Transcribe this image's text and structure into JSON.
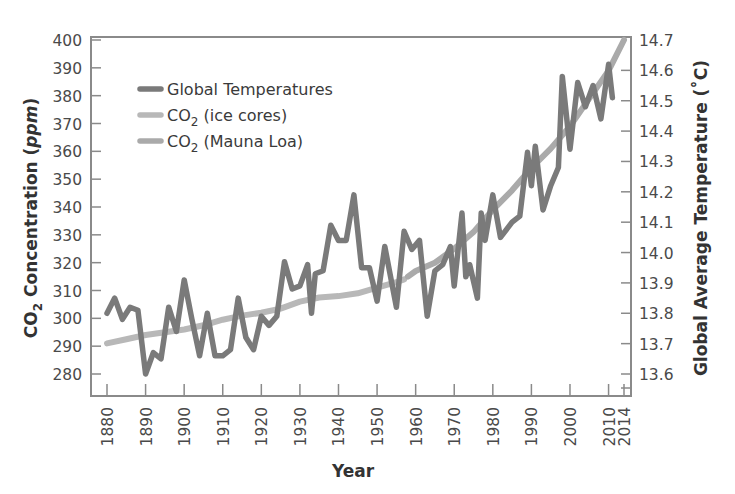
{
  "chart_data": {
    "type": "line",
    "title": "",
    "xlabel": "Year",
    "ylabel_left": "CO2 Concentration (ppm)",
    "ylabel_right": "Global Average Temperature (°C)",
    "xlim": [
      1876,
      2016
    ],
    "ylim_left": [
      280,
      400
    ],
    "ylim_right": [
      13.6,
      14.7
    ],
    "x_ticks": [
      1880,
      1890,
      1900,
      1910,
      1920,
      1930,
      1940,
      1950,
      1960,
      1970,
      1980,
      1990,
      2000,
      2010,
      2014
    ],
    "y_left_ticks": [
      280,
      290,
      300,
      310,
      320,
      330,
      340,
      350,
      360,
      370,
      380,
      390,
      400
    ],
    "y_right_ticks": [
      "13.6",
      "13.7",
      "13.8",
      "13.9",
      "14.0",
      "14.1",
      "14.2",
      "14.3",
      "14.4",
      "14.5",
      "14.6",
      "14.7"
    ],
    "grid": false,
    "legend_position": "upper-left",
    "series": [
      {
        "name": "Global Temperatures",
        "axis": "right",
        "color": "#7a7a7a",
        "x": [
          1880,
          1882,
          1884,
          1886,
          1888,
          1890,
          1892,
          1894,
          1896,
          1898,
          1900,
          1902,
          1904,
          1906,
          1908,
          1910,
          1912,
          1914,
          1916,
          1918,
          1920,
          1922,
          1924,
          1926,
          1928,
          1930,
          1932,
          1933,
          1934,
          1936,
          1938,
          1940,
          1942,
          1944,
          1946,
          1948,
          1950,
          1952,
          1955,
          1957,
          1959,
          1961,
          1963,
          1965,
          1967,
          1969,
          1970,
          1972,
          1973,
          1974,
          1976,
          1977,
          1978,
          1980,
          1982,
          1985,
          1987,
          1989,
          1990,
          1991,
          1993,
          1995,
          1997,
          1998,
          2000,
          2002,
          2004,
          2006,
          2008,
          2010,
          2011
        ],
        "values": [
          13.8,
          13.85,
          13.78,
          13.82,
          13.81,
          13.6,
          13.67,
          13.65,
          13.82,
          13.74,
          13.91,
          13.78,
          13.66,
          13.8,
          13.66,
          13.66,
          13.68,
          13.85,
          13.72,
          13.68,
          13.79,
          13.76,
          13.79,
          13.97,
          13.88,
          13.89,
          13.96,
          13.8,
          13.93,
          13.94,
          14.09,
          14.04,
          14.04,
          14.19,
          13.95,
          13.95,
          13.84,
          14.02,
          13.82,
          14.07,
          14.01,
          14.04,
          13.79,
          13.94,
          13.96,
          14.02,
          13.89,
          14.13,
          13.92,
          13.96,
          13.85,
          14.13,
          14.04,
          14.19,
          14.05,
          14.1,
          14.12,
          14.33,
          14.22,
          14.35,
          14.14,
          14.22,
          14.28,
          14.58,
          14.34,
          14.56,
          14.48,
          14.55,
          14.44,
          14.62,
          14.51
        ]
      },
      {
        "name": "CO2 (ice cores)",
        "axis": "left",
        "color": "#b8b8b8",
        "x": [
          1880,
          1885,
          1890,
          1895,
          1900,
          1905,
          1910,
          1915,
          1920,
          1925,
          1930,
          1935,
          1940,
          1945,
          1950,
          1955,
          1957
        ],
        "values": [
          291,
          292.5,
          294,
          295,
          296,
          297.5,
          299.5,
          301,
          302,
          303.5,
          306,
          307.5,
          308,
          309,
          311,
          313,
          314
        ]
      },
      {
        "name": "CO2 (Mauna Loa)",
        "axis": "left",
        "color": "#aaaaaa",
        "x": [
          1958,
          1960,
          1965,
          1970,
          1975,
          1980,
          1985,
          1990,
          1995,
          2000,
          2005,
          2010,
          2014
        ],
        "values": [
          315,
          317,
          320,
          325,
          331,
          339,
          346,
          354,
          361,
          369,
          379,
          389,
          400
        ]
      }
    ]
  },
  "legend": {
    "items": [
      {
        "label": "Global Temperatures",
        "main": "Global Temperatures",
        "sub": "",
        "rest": "",
        "color": "#7a7a7a"
      },
      {
        "label": "CO2 (ice cores)",
        "main": "CO",
        "sub": "2",
        "rest": " (ice cores)",
        "color": "#b8b8b8"
      },
      {
        "label": "CO2 (Mauna Loa)",
        "main": "CO",
        "sub": "2",
        "rest": " (Mauna Loa)",
        "color": "#aaaaaa"
      }
    ]
  },
  "axes": {
    "x_title": "Year",
    "left_title_main": "CO",
    "left_title_sub": "2",
    "left_title_rest": " Concentration (",
    "left_title_unit": "ppm",
    "left_title_close": ")",
    "right_title": "Global Average Temperature (˚C)"
  },
  "style": {
    "frame_color": "#8a8a8a",
    "text_color": "#4a4a4a"
  }
}
